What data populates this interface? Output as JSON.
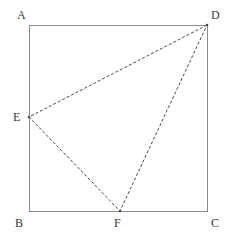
{
  "figure": {
    "background_color": "#ffffff",
    "outline_color": "#8a8a8a",
    "dash_color": "#4a4a4a",
    "label_color": "#3a3a3a",
    "outline_width": 1,
    "dash_width": 1,
    "dash_pattern": "3 2"
  },
  "chart_data": {
    "type": "diagram",
    "coordinate_space": {
      "width": 229,
      "height": 242,
      "units": "px"
    },
    "points": [
      {
        "id": "A",
        "label": "A",
        "x": 29,
        "y": 25,
        "label_x": 17,
        "label_y": 9,
        "on": "square-corner-top-left"
      },
      {
        "id": "D",
        "label": "D",
        "x": 207,
        "y": 25,
        "label_x": 211,
        "label_y": 9,
        "on": "square-corner-top-right"
      },
      {
        "id": "B",
        "label": "B",
        "x": 29,
        "y": 211,
        "label_x": 15,
        "label_y": 217,
        "on": "square-corner-bottom-left"
      },
      {
        "id": "C",
        "label": "C",
        "x": 207,
        "y": 211,
        "label_x": 211,
        "label_y": 217,
        "on": "square-corner-bottom-right"
      },
      {
        "id": "E",
        "label": "E",
        "x": 29,
        "y": 117,
        "label_x": 13,
        "label_y": 111,
        "on": "side-AB"
      },
      {
        "id": "F",
        "label": "F",
        "x": 120,
        "y": 211,
        "label_x": 114,
        "label_y": 217,
        "on": "side-BC"
      }
    ],
    "solid_edges": [
      {
        "id": "AD",
        "from": "A",
        "to": "D"
      },
      {
        "id": "DC",
        "from": "D",
        "to": "C"
      },
      {
        "id": "CB",
        "from": "C",
        "to": "B"
      },
      {
        "id": "BA",
        "from": "B",
        "to": "A"
      }
    ],
    "dashed_edges": [
      {
        "id": "DE",
        "from": "D",
        "to": "E"
      },
      {
        "id": "EF",
        "from": "E",
        "to": "F"
      },
      {
        "id": "FD",
        "from": "F",
        "to": "D"
      }
    ],
    "square_path": "M 29 25 L 207 25 L 207 211 L 29 211 Z",
    "dashed_triangle_path": "M 207 25 L 29 117 L 120 211 Z"
  }
}
